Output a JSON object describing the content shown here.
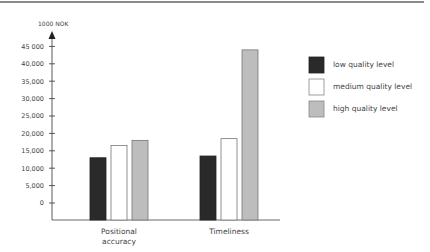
{
  "chart_data": {
    "type": "bar",
    "title": "",
    "xlabel": "",
    "ylabel": "1000 NOK",
    "categories": [
      [
        "Positional",
        "accuracy"
      ],
      [
        "Timeliness"
      ]
    ],
    "series": [
      {
        "name": "low quality level",
        "color": "#2a2a2a",
        "values": [
          13000,
          13500
        ]
      },
      {
        "name": "medium quality level",
        "color": "#ffffff",
        "values": [
          16500,
          18500
        ]
      },
      {
        "name": "high quality level",
        "color": "#bdbdbd",
        "values": [
          18000,
          44000
        ]
      }
    ],
    "yticks": [
      0,
      5000,
      10000,
      15000,
      20000,
      25000,
      30000,
      35000,
      40000,
      45000
    ],
    "ytick_labels": [
      "0",
      "5,000",
      "10,000",
      "15,000",
      "20,000",
      "25,000",
      "30,000",
      "35,000",
      "40,000",
      "45 000"
    ],
    "ylim": [
      0,
      45000
    ],
    "grid": false,
    "legend_position": "right"
  }
}
